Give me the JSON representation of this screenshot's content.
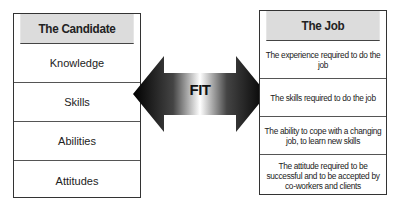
{
  "candidate": {
    "title": "The Candidate",
    "items": [
      "Knowledge",
      "Skills",
      "Abilities",
      "Attitudes"
    ]
  },
  "job": {
    "title": "The Job",
    "items": [
      "The experience required to do the job",
      "The skills required to do the job",
      "The ability to cope with a changing job, to learn new skills",
      "The attitude required to be successful and to be accepted by co-workers and clients"
    ]
  },
  "arrow": {
    "label": "FIT",
    "colors": {
      "dark": "#000000",
      "light": "#ffffff"
    }
  }
}
